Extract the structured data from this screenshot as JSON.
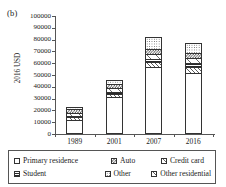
{
  "panel": {
    "label": "(b)"
  },
  "chart_data": {
    "type": "bar",
    "stacked": true,
    "title": "",
    "subtitle": "",
    "xlabel": "",
    "ylabel": "2016 USD",
    "ylim": [
      0,
      100000
    ],
    "ytick_step": 10000,
    "yticks": [
      "100000",
      "90000",
      "80000",
      "70000",
      "60000",
      "50000",
      "40000",
      "30000",
      "20000",
      "10000",
      "0"
    ],
    "grid": false,
    "legend_position": "bottom",
    "categories": [
      "1989",
      "2001",
      "2007",
      "2016"
    ],
    "series": [
      {
        "name": "Primary residence",
        "pattern": "white",
        "values": [
          12000,
          31000,
          57000,
          52000
        ]
      },
      {
        "name": "Other residential",
        "pattern": "diag",
        "values": [
          2000,
          3000,
          4000,
          5000
        ]
      },
      {
        "name": "Student",
        "pattern": "solidhoriz",
        "values": [
          1000,
          1500,
          2500,
          3500
        ]
      },
      {
        "name": "Credit card",
        "pattern": "lightdiag",
        "values": [
          2500,
          3500,
          4000,
          4000
        ]
      },
      {
        "name": "Auto",
        "pattern": "checker",
        "values": [
          3500,
          3000,
          4500,
          4500
        ]
      },
      {
        "name": "Other",
        "pattern": "dots",
        "values": [
          2000,
          4000,
          10000,
          8000
        ]
      }
    ],
    "totals": [
      23000,
      46000,
      82000,
      77000
    ]
  },
  "legend": {
    "entries": [
      {
        "label": "Primary residence",
        "pattern": "white"
      },
      {
        "label": "Auto",
        "pattern": "checker"
      },
      {
        "label": "Credit card",
        "pattern": "lightdiag"
      },
      {
        "label": "Student",
        "pattern": "solidhoriz"
      },
      {
        "label": "Other",
        "pattern": "dots"
      },
      {
        "label": "Other residential",
        "pattern": "diag"
      }
    ]
  }
}
